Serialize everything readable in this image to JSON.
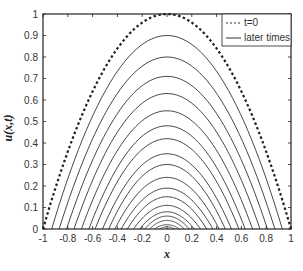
{
  "chart_data": {
    "type": "line",
    "title": "",
    "xlabel": "x",
    "ylabel": "u(x,t)",
    "xlim": [
      -1,
      1
    ],
    "ylim": [
      0,
      1
    ],
    "xticks": [
      -1,
      -0.8,
      -0.6,
      -0.4,
      -0.2,
      0,
      0.2,
      0.4,
      0.6,
      0.8,
      1
    ],
    "xtick_labels": [
      "-1",
      "-0.8",
      "-0.6",
      "-0.4",
      "-0.2",
      "0",
      "0.2",
      "0.4",
      "0.6",
      "0.8",
      "1"
    ],
    "yticks": [
      0,
      0.1,
      0.2,
      0.3,
      0.4,
      0.5,
      0.6,
      0.7,
      0.8,
      0.9,
      1
    ],
    "ytick_labels": [
      "0",
      "0.1",
      "0.2",
      "0.3",
      "0.4",
      "0.5",
      "0.6",
      "0.7",
      "0.8",
      "0.9",
      "1"
    ],
    "grid": false,
    "legend_position": "upper right",
    "legend": [
      {
        "label": "t=0",
        "style": "dashed"
      },
      {
        "label": "later times",
        "style": "solid"
      }
    ],
    "series": [
      {
        "name": "t=0",
        "style": "dashed",
        "half_width": 1.0,
        "peak": 1.0
      },
      {
        "name": "later times",
        "style": "solid",
        "curves": [
          {
            "half_width": 0.93,
            "peak": 0.9
          },
          {
            "half_width": 0.87,
            "peak": 0.8
          },
          {
            "half_width": 0.81,
            "peak": 0.71
          },
          {
            "half_width": 0.75,
            "peak": 0.63
          },
          {
            "half_width": 0.69,
            "peak": 0.55
          },
          {
            "half_width": 0.63,
            "peak": 0.48
          },
          {
            "half_width": 0.58,
            "peak": 0.42
          },
          {
            "half_width": 0.52,
            "peak": 0.35
          },
          {
            "half_width": 0.47,
            "peak": 0.3
          },
          {
            "half_width": 0.42,
            "peak": 0.24
          },
          {
            "half_width": 0.37,
            "peak": 0.19
          },
          {
            "half_width": 0.32,
            "peak": 0.15
          },
          {
            "half_width": 0.27,
            "peak": 0.11
          },
          {
            "half_width": 0.22,
            "peak": 0.08
          },
          {
            "half_width": 0.18,
            "peak": 0.06
          },
          {
            "half_width": 0.14,
            "peak": 0.04
          },
          {
            "half_width": 0.1,
            "peak": 0.02
          },
          {
            "half_width": 0.06,
            "peak": 0.01
          }
        ]
      }
    ]
  },
  "colors": {
    "line": "#333333",
    "axis": "#222222",
    "background": "#ffffff"
  }
}
